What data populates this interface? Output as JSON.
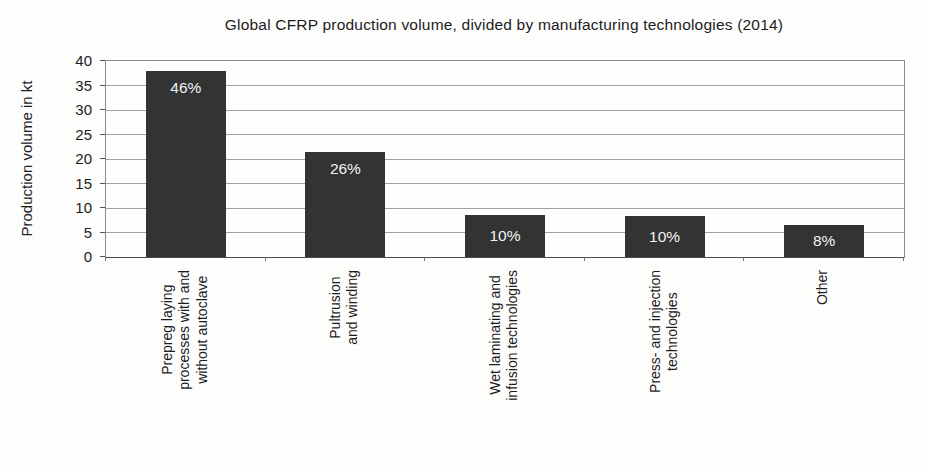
{
  "chart_data": {
    "type": "bar",
    "title": "Global CFRP production volume, divided by manufacturing technologies (2014)",
    "xlabel": "",
    "ylabel": "Production volume  in kt",
    "ylim": [
      0,
      40
    ],
    "yticks": [
      0,
      5,
      10,
      15,
      20,
      25,
      30,
      35,
      40
    ],
    "grid": "horizontal",
    "legend": "none",
    "categories": [
      [
        "Prepreg laying",
        "processes with and",
        "without autoclave"
      ],
      [
        "Pultrusion",
        "and winding"
      ],
      [
        "Wet laminating and",
        "infusion technologies"
      ],
      [
        "Press- and injection",
        "technologies"
      ],
      [
        "Other"
      ]
    ],
    "values": [
      38,
      21.5,
      8.5,
      8.3,
      6.5
    ],
    "bar_labels": [
      "46%",
      "26%",
      "10%",
      "10%",
      "8%"
    ],
    "colors": {
      "bar_fill": "#333333",
      "bar_label_text": "#f2f2f2",
      "gridline": "#a3a3a3",
      "plot_border": "#8a8a8a",
      "axis_line": "#4a4a4a",
      "text": "#1c1c1c",
      "background": "#fdfdfc"
    }
  }
}
